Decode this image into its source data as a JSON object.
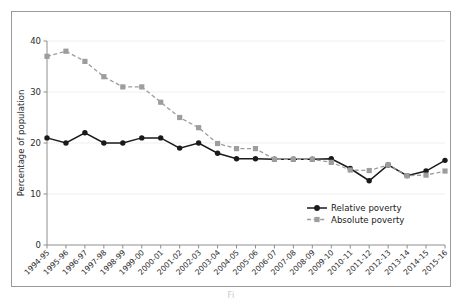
{
  "figure": {
    "caption_fragment": "Fi",
    "frame_color": "#9a9a9a",
    "background": "#ffffff"
  },
  "axes": {
    "ylabel": "Percentage of population",
    "yticks": [
      "0",
      "10",
      "20",
      "30",
      "40"
    ],
    "ytick_values": [
      0,
      10,
      20,
      30,
      40
    ],
    "xlabel": ""
  },
  "legend": {
    "items": [
      {
        "label": "Relative poverty",
        "color": "#1a1a1a",
        "marker": "circle",
        "style": "solid"
      },
      {
        "label": "Absolute poverty",
        "color": "#9d9d9d",
        "marker": "square",
        "style": "dashed"
      }
    ]
  },
  "chart_data": {
    "type": "line",
    "title": "",
    "xlabel": "",
    "ylabel": "Percentage of population",
    "ylim": [
      0,
      40
    ],
    "grid": true,
    "legend_position": "bottom-right",
    "categories": [
      "1994-95",
      "1995-96",
      "1996-97",
      "1997-98",
      "1998-99",
      "1999-00",
      "2000-01",
      "2001-02",
      "2002-03",
      "2003-04",
      "2004-05",
      "2005-06",
      "2006-07",
      "2007-08",
      "2008-09",
      "2009-10",
      "2010-11",
      "2011-12",
      "2012-13",
      "2013-14",
      "2014-15",
      "2015-16"
    ],
    "series": [
      {
        "name": "Relative poverty",
        "color": "#1a1a1a",
        "marker": "circle",
        "style": "solid",
        "values": [
          21.0,
          20.0,
          22.0,
          20.0,
          20.0,
          21.0,
          21.0,
          19.0,
          20.0,
          18.0,
          16.9,
          16.9,
          16.8,
          16.8,
          16.8,
          16.9,
          15.0,
          12.6,
          15.7,
          13.6,
          14.5,
          16.6
        ]
      },
      {
        "name": "Absolute poverty",
        "color": "#9d9d9d",
        "marker": "square",
        "style": "dashed",
        "values": [
          37.0,
          38.0,
          36.0,
          33.0,
          31.0,
          31.0,
          28.0,
          25.0,
          23.0,
          19.9,
          18.9,
          18.9,
          16.8,
          16.8,
          16.8,
          16.2,
          14.7,
          14.6,
          15.7,
          13.6,
          13.7,
          14.5
        ]
      }
    ]
  }
}
